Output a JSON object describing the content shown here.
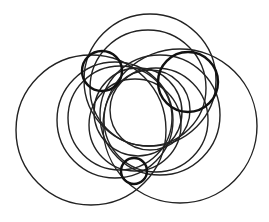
{
  "diagram": {
    "type": "overlapping-circles",
    "background": "#ffffff",
    "stroke_color": "#222222",
    "circles": [
      {
        "id": "big-left",
        "cx": 91,
        "cy": 130,
        "r": 75,
        "bold": false
      },
      {
        "id": "big-right",
        "cx": 180,
        "cy": 126,
        "r": 77,
        "bold": false
      },
      {
        "id": "top-outer",
        "cx": 150,
        "cy": 80,
        "r": 66,
        "bold": false
      },
      {
        "id": "top-inner",
        "cx": 148,
        "cy": 88,
        "r": 58,
        "bold": false
      },
      {
        "id": "mid-left-a",
        "cx": 115,
        "cy": 120,
        "r": 58,
        "bold": false
      },
      {
        "id": "mid-left-b",
        "cx": 120,
        "cy": 118,
        "r": 52,
        "bold": false
      },
      {
        "id": "mid-right-a",
        "cx": 160,
        "cy": 115,
        "r": 60,
        "bold": false
      },
      {
        "id": "mid-right-b",
        "cx": 156,
        "cy": 120,
        "r": 52,
        "bold": false
      },
      {
        "id": "center-lens-left",
        "cx": 138,
        "cy": 112,
        "r": 44,
        "bold": false
      },
      {
        "id": "center-lens-right",
        "cx": 150,
        "cy": 110,
        "r": 40,
        "bold": false
      },
      {
        "id": "inner-mid",
        "cx": 135,
        "cy": 125,
        "r": 46,
        "bold": false
      },
      {
        "id": "small-left",
        "cx": 102,
        "cy": 71,
        "r": 20,
        "bold": true
      },
      {
        "id": "small-right",
        "cx": 188,
        "cy": 82,
        "r": 30,
        "bold": true
      },
      {
        "id": "small-bottom",
        "cx": 134,
        "cy": 171,
        "r": 13,
        "bold": true
      }
    ]
  }
}
